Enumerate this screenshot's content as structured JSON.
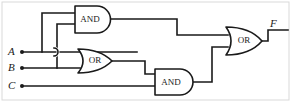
{
  "figure": {
    "background_color": "#ffffff",
    "stroke_color": "#1a1a1a",
    "frame_color": "#d9d9d9"
  },
  "inputs": [
    {
      "label": "A",
      "x": 10,
      "y": 52,
      "dot_x": 22
    },
    {
      "label": "B",
      "x": 10,
      "y": 68,
      "dot_x": 22
    },
    {
      "label": "C",
      "x": 10,
      "y": 86,
      "dot_x": 22
    }
  ],
  "outputs": [
    {
      "label": "F",
      "x": 272,
      "y": 28
    }
  ],
  "gates": [
    {
      "name": "and-gate-top",
      "type": "AND",
      "label": "AND",
      "x": 75,
      "y": 6,
      "width": 36,
      "height": 27,
      "inputs": [
        "A",
        "B"
      ],
      "label_cx": 91,
      "label_cy": 19
    },
    {
      "name": "or-gate-middle",
      "type": "OR",
      "label": "OR",
      "x": 78,
      "y": 49,
      "width": 34,
      "height": 24,
      "inputs": [
        "A",
        "B"
      ],
      "label_cx": 97,
      "label_cy": 61
    },
    {
      "name": "and-gate-bottom",
      "type": "AND",
      "label": "AND",
      "x": 155,
      "y": 69,
      "width": 38,
      "height": 26,
      "inputs": [
        "or-gate-middle",
        "C"
      ],
      "label_cx": 171,
      "label_cy": 82
    },
    {
      "name": "or-gate-output",
      "type": "OR",
      "label": "OR",
      "x": 226,
      "y": 27,
      "width": 36,
      "height": 28,
      "inputs": [
        "and-gate-top",
        "and-gate-bottom"
      ],
      "label_cx": 246,
      "label_cy": 41
    }
  ],
  "wires": [
    {
      "name": "wire-a-trunk",
      "d": "M 22 52 H 137"
    },
    {
      "name": "wire-b-trunk",
      "d": "M 22 68 H 80"
    },
    {
      "name": "wire-c-trunk",
      "d": "M 22 86 H 158"
    },
    {
      "name": "wire-a-branch-up-to-and",
      "d": "M 42 52 V 13 H 77"
    },
    {
      "name": "wire-b-branch-up-to-and",
      "d": "M 57 68 V 24 H 77"
    },
    {
      "name": "wire-and-top-out",
      "d": "M 111 19 H 177 V 35 H 228"
    },
    {
      "name": "wire-or-mid-out",
      "d": "M 112 61 H 145 V 74 H 157"
    },
    {
      "name": "wire-and-bot-out",
      "d": "M 193 82 H 212 V 47 H 228"
    },
    {
      "name": "wire-output-f",
      "d": "M 262 41 H 268 V 30 H 288"
    }
  ],
  "hops": [
    {
      "name": "wire-hop-b-over-a",
      "cx": 57,
      "cy": 52,
      "r": 3
    }
  ],
  "frame": {
    "x": 2,
    "y": 2,
    "width": 287,
    "height": 98
  }
}
